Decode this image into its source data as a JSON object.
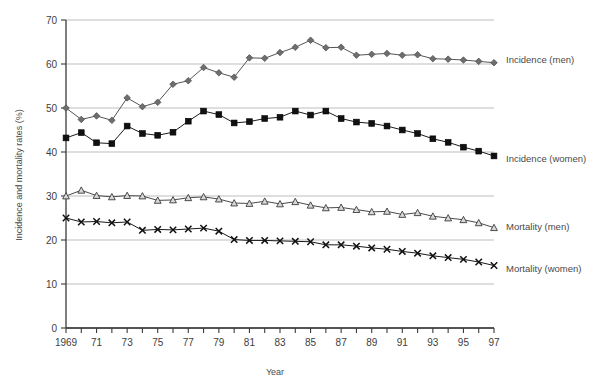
{
  "chart_data": {
    "type": "line",
    "title": "",
    "xlabel": "Year",
    "ylabel": "Incidence and mortality rates (%)",
    "xlim": [
      1969,
      1997
    ],
    "ylim": [
      0,
      70
    ],
    "yticks": [
      0,
      10,
      20,
      30,
      40,
      50,
      60,
      70
    ],
    "ytick_labels": [
      "0",
      "10",
      "20",
      "30",
      "40",
      "50",
      "60",
      "70"
    ],
    "x": [
      1969,
      1970,
      1971,
      1972,
      1973,
      1974,
      1975,
      1976,
      1977,
      1978,
      1979,
      1980,
      1981,
      1982,
      1983,
      1984,
      1985,
      1986,
      1987,
      1988,
      1989,
      1990,
      1991,
      1992,
      1993,
      1994,
      1995,
      1996,
      1997
    ],
    "xtick_labels": [
      "1969",
      "",
      "71",
      "",
      "73",
      "",
      "75",
      "",
      "77",
      "",
      "79",
      "",
      "81",
      "",
      "83",
      "",
      "85",
      "",
      "87",
      "",
      "89",
      "",
      "91",
      "",
      "93",
      "",
      "95",
      "",
      "97"
    ],
    "grid": "horizontal",
    "legend_position": "right-inline",
    "series": [
      {
        "name": "Incidence (men)",
        "marker": "diamond",
        "color": "#6e6e6e",
        "line_color": "#555555",
        "values": [
          50.0,
          47.4,
          48.2,
          47.2,
          52.3,
          50.3,
          51.3,
          55.4,
          56.2,
          59.2,
          58.0,
          57.0,
          61.4,
          61.3,
          62.6,
          63.8,
          65.4,
          63.7,
          63.8,
          62.0,
          62.2,
          62.4,
          62.0,
          62.1,
          61.2,
          61.1,
          60.9,
          60.6,
          60.3
        ]
      },
      {
        "name": "Incidence (women)",
        "marker": "square",
        "color": "#111111",
        "line_color": "#1a1a1a",
        "values": [
          43.2,
          44.4,
          42.1,
          41.9,
          45.9,
          44.2,
          43.8,
          44.5,
          47.0,
          49.3,
          48.5,
          46.6,
          46.9,
          47.6,
          47.9,
          49.3,
          48.4,
          49.3,
          47.6,
          46.8,
          46.5,
          45.9,
          45.0,
          44.2,
          43.0,
          42.2,
          41.1,
          40.2,
          39.1
        ]
      },
      {
        "name": "Mortality (men)",
        "marker": "triangle",
        "color": "#8a8a8a",
        "line_color": "#4a4a4a",
        "values": [
          30.0,
          31.3,
          30.1,
          29.8,
          30.1,
          30.0,
          29.0,
          29.1,
          29.6,
          29.8,
          29.3,
          28.4,
          28.3,
          28.8,
          28.2,
          28.7,
          27.9,
          27.3,
          27.4,
          26.9,
          26.4,
          26.5,
          25.8,
          26.2,
          25.4,
          25.0,
          24.6,
          23.9,
          22.8
        ]
      },
      {
        "name": "Mortality (women)",
        "marker": "cross",
        "color": "#111111",
        "line_color": "#1a1a1a",
        "values": [
          25.0,
          24.1,
          24.2,
          23.9,
          24.1,
          22.2,
          22.4,
          22.3,
          22.5,
          22.7,
          22.0,
          20.1,
          19.9,
          19.9,
          19.8,
          19.7,
          19.6,
          18.9,
          18.9,
          18.6,
          18.2,
          17.9,
          17.4,
          17.0,
          16.4,
          16.0,
          15.6,
          15.0,
          14.2
        ]
      }
    ]
  },
  "legend": {
    "items": [
      {
        "label": "Incidence (men)"
      },
      {
        "label": "Incidence (women)"
      },
      {
        "label": "Mortality (men)"
      },
      {
        "label": "Mortality (women)"
      }
    ]
  }
}
